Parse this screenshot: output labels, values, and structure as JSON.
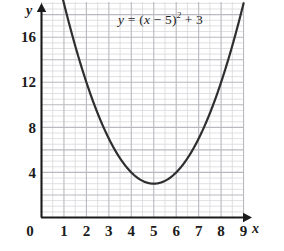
{
  "figure": {
    "equation_label": {
      "lhs": "y",
      "eq": " = (",
      "var": "x",
      "mid": " − 5)",
      "exp": "2",
      "tail": " + 3"
    },
    "axis_names": {
      "x": "x",
      "y": "y"
    },
    "origin_label": "0"
  },
  "chart_data": {
    "type": "line",
    "title": "",
    "subtitle": "",
    "annotations": [
      {
        "text": "y = (x − 5)² + 3",
        "x": 6.5,
        "y": 18.5
      }
    ],
    "function": "y = (x - 5)^2 + 3",
    "vertex": [
      5,
      3
    ],
    "xlabel": "x",
    "ylabel": "y",
    "xlim": [
      0,
      9
    ],
    "ylim": [
      0,
      19.4
    ],
    "xticks": [
      0,
      1,
      2,
      3,
      4,
      5,
      6,
      7,
      8,
      9
    ],
    "xtick_labels": [
      "0",
      "1",
      "2",
      "3",
      "4",
      "5",
      "6",
      "7",
      "8",
      "9"
    ],
    "yticks": [
      4,
      8,
      12,
      16
    ],
    "ytick_labels": [
      "4",
      "8",
      "12",
      "16"
    ],
    "grid": true,
    "grid_major_step_x": 1,
    "grid_major_step_y": 2,
    "grid_minor_step_x": 0.5,
    "grid_minor_step_y": 0.5,
    "legend": "none",
    "x": [
      0,
      0.25,
      0.5,
      0.75,
      1,
      1.25,
      1.5,
      1.75,
      2,
      2.25,
      2.5,
      2.75,
      3,
      3.25,
      3.5,
      3.75,
      4,
      4.25,
      4.5,
      4.75,
      5,
      5.25,
      5.5,
      5.75,
      6,
      6.25,
      6.5,
      6.75,
      7,
      7.25,
      7.5,
      7.75,
      8,
      8.25,
      8.5,
      8.75,
      9
    ],
    "y": [
      28,
      25.56,
      23.25,
      21.06,
      19,
      17.06,
      15.25,
      13.56,
      12,
      10.56,
      9.25,
      8.06,
      7,
      6.06,
      5.25,
      4.56,
      4,
      3.56,
      3.25,
      3.06,
      3,
      3.06,
      3.25,
      3.56,
      4,
      4.56,
      5.25,
      6.06,
      7,
      8.06,
      9.25,
      10.56,
      12,
      13.56,
      15.25,
      17.06,
      19
    ],
    "colors": {
      "curve": "#2e2e2e",
      "axis": "#1a1a1a",
      "grid_major": "#b9b9bf",
      "grid_minor": "#d8d8dc",
      "background": "#ffffff"
    }
  }
}
